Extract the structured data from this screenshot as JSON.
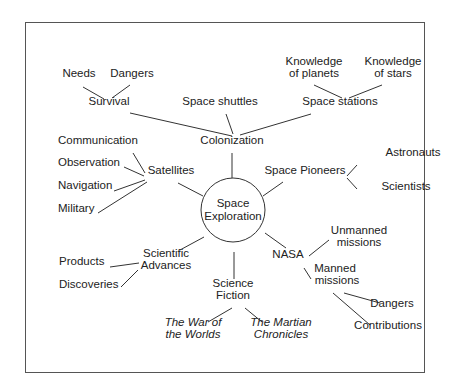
{
  "diagram": {
    "center": {
      "label_line1": "Space",
      "label_line2": "Exploration"
    },
    "nodes": [
      {
        "id": "survival",
        "label": "Survival",
        "x": 109,
        "y": 101
      },
      {
        "id": "needs",
        "label": "Needs",
        "x": 79,
        "y": 73
      },
      {
        "id": "dangers_survival",
        "label": "Dangers",
        "x": 132,
        "y": 73
      },
      {
        "id": "space_shuttles",
        "label": "Space shuttles",
        "x": 220,
        "y": 101
      },
      {
        "id": "colonization",
        "label": "Colonization",
        "x": 232,
        "y": 140
      },
      {
        "id": "space_stations",
        "label": "Space stations",
        "x": 340,
        "y": 101
      },
      {
        "id": "knowledge_planets_1",
        "label": "Knowledge",
        "x": 314,
        "y": 61
      },
      {
        "id": "knowledge_planets_2",
        "label": "of planets",
        "x": 314,
        "y": 73
      },
      {
        "id": "knowledge_stars_1",
        "label": "Knowledge",
        "x": 393,
        "y": 61
      },
      {
        "id": "knowledge_stars_2",
        "label": "of stars",
        "x": 393,
        "y": 73
      },
      {
        "id": "satellites",
        "label": "Satellites",
        "x": 171,
        "y": 170
      },
      {
        "id": "communication",
        "label": "Communication",
        "x": 58,
        "y": 140,
        "left": true
      },
      {
        "id": "observation",
        "label": "Observation",
        "x": 58,
        "y": 162,
        "left": true
      },
      {
        "id": "navigation",
        "label": "Navigation",
        "x": 58,
        "y": 185,
        "left": true
      },
      {
        "id": "military",
        "label": "Military",
        "x": 58,
        "y": 208,
        "left": true
      },
      {
        "id": "space_pioneers",
        "label": "Space Pioneers",
        "x": 305,
        "y": 170
      },
      {
        "id": "astronauts",
        "label": "Astronauts",
        "x": 413,
        "y": 152
      },
      {
        "id": "scientists",
        "label": "Scientists",
        "x": 406,
        "y": 186
      },
      {
        "id": "sci_adv_1",
        "label": "Scientific",
        "x": 166,
        "y": 253
      },
      {
        "id": "sci_adv_2",
        "label": "Advances",
        "x": 166,
        "y": 265
      },
      {
        "id": "products",
        "label": "Products",
        "x": 59,
        "y": 261,
        "left": true
      },
      {
        "id": "discoveries",
        "label": "Discoveries",
        "x": 59,
        "y": 284,
        "left": true
      },
      {
        "id": "sci_fic_1",
        "label": "Science",
        "x": 233,
        "y": 283
      },
      {
        "id": "sci_fic_2",
        "label": "Fiction",
        "x": 233,
        "y": 295
      },
      {
        "id": "war_worlds_1",
        "label": "The War of",
        "x": 193,
        "y": 322,
        "italic": true
      },
      {
        "id": "war_worlds_2",
        "label": "the Worlds",
        "x": 193,
        "y": 334,
        "italic": true
      },
      {
        "id": "martian_1",
        "label": "The Martian",
        "x": 281,
        "y": 322,
        "italic": true
      },
      {
        "id": "martian_2",
        "label": "Chronicles",
        "x": 281,
        "y": 334,
        "italic": true
      },
      {
        "id": "nasa",
        "label": "NASA",
        "x": 288,
        "y": 254
      },
      {
        "id": "unmanned_1",
        "label": "Unmanned",
        "x": 359,
        "y": 230
      },
      {
        "id": "unmanned_2",
        "label": "missions",
        "x": 359,
        "y": 242
      },
      {
        "id": "manned_1",
        "label": "Manned",
        "x": 335,
        "y": 268
      },
      {
        "id": "manned_2",
        "label": "missions",
        "x": 337,
        "y": 280
      },
      {
        "id": "dangers_manned",
        "label": "Dangers",
        "x": 392,
        "y": 303
      },
      {
        "id": "contributions",
        "label": "Contributions",
        "x": 388,
        "y": 325
      }
    ]
  }
}
